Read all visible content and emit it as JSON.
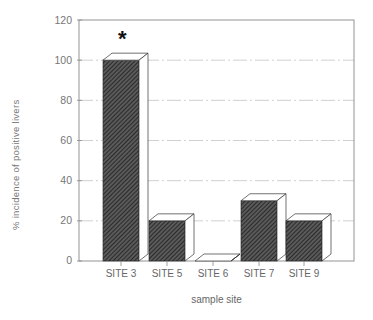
{
  "chart_data": {
    "type": "bar",
    "title": "",
    "xlabel": "sample site",
    "ylabel": "% incidence of positive livers",
    "categories": [
      "SITE 3",
      "SITE 5",
      "SITE 6",
      "SITE 7",
      "SITE 9"
    ],
    "values": [
      100,
      20,
      0,
      30,
      20
    ],
    "ylim": [
      0,
      120
    ],
    "yticks": [
      0,
      20,
      40,
      60,
      80,
      100,
      120
    ],
    "grid": true,
    "legend": null,
    "annotations": [
      {
        "category": "SITE 3",
        "text": "*"
      }
    ],
    "style": {
      "bar_fill": "hatched dark gray",
      "bar_3d": true
    }
  },
  "axis": {
    "ylabel": "% incidence of positive livers",
    "xlabel": "sample site",
    "yticks": [
      "0",
      "20",
      "40",
      "60",
      "80",
      "100",
      "120"
    ],
    "categories": [
      "SITE 3",
      "SITE 5",
      "SITE 6",
      "SITE 7",
      "SITE 9"
    ]
  },
  "annotation": {
    "star": "*"
  },
  "colors": {
    "bar": "#3a3a3a",
    "axis": "#888888",
    "grid": "#bbbbbb"
  }
}
